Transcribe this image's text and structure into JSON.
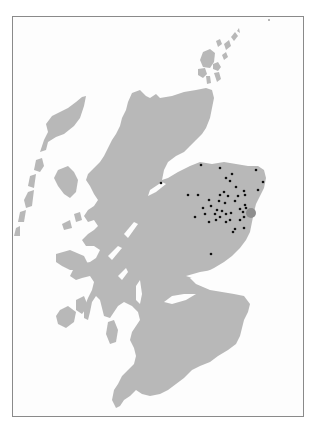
{
  "map": {
    "subject": "Scotland",
    "land_color": "#b8b8b8",
    "frame_color": "#8a8a8a",
    "dot_color": "#111111",
    "hub_color": "#8e8e8e",
    "hub": {
      "x": 251,
      "y": 213,
      "r": 5
    },
    "points": [
      {
        "x": 201,
        "y": 165
      },
      {
        "x": 161,
        "y": 183
      },
      {
        "x": 220,
        "y": 168
      },
      {
        "x": 232,
        "y": 174
      },
      {
        "x": 256,
        "y": 170
      },
      {
        "x": 263,
        "y": 182
      },
      {
        "x": 226,
        "y": 178
      },
      {
        "x": 230,
        "y": 181
      },
      {
        "x": 188,
        "y": 195
      },
      {
        "x": 198,
        "y": 195
      },
      {
        "x": 236,
        "y": 187
      },
      {
        "x": 224,
        "y": 192
      },
      {
        "x": 244,
        "y": 191
      },
      {
        "x": 245,
        "y": 195
      },
      {
        "x": 258,
        "y": 190
      },
      {
        "x": 209,
        "y": 200
      },
      {
        "x": 220,
        "y": 195
      },
      {
        "x": 228,
        "y": 196
      },
      {
        "x": 238,
        "y": 196
      },
      {
        "x": 219,
        "y": 201
      },
      {
        "x": 225,
        "y": 203
      },
      {
        "x": 235,
        "y": 201
      },
      {
        "x": 211,
        "y": 206
      },
      {
        "x": 203,
        "y": 208
      },
      {
        "x": 217,
        "y": 210
      },
      {
        "x": 222,
        "y": 211
      },
      {
        "x": 215,
        "y": 214
      },
      {
        "x": 226,
        "y": 214
      },
      {
        "x": 231,
        "y": 213
      },
      {
        "x": 240,
        "y": 209
      },
      {
        "x": 245,
        "y": 205
      },
      {
        "x": 243,
        "y": 212
      },
      {
        "x": 246,
        "y": 208
      },
      {
        "x": 195,
        "y": 217
      },
      {
        "x": 205,
        "y": 214
      },
      {
        "x": 220,
        "y": 217
      },
      {
        "x": 230,
        "y": 220
      },
      {
        "x": 240,
        "y": 220
      },
      {
        "x": 244,
        "y": 217
      },
      {
        "x": 209,
        "y": 222
      },
      {
        "x": 235,
        "y": 229
      },
      {
        "x": 233,
        "y": 232
      },
      {
        "x": 244,
        "y": 228
      },
      {
        "x": 211,
        "y": 254
      },
      {
        "x": 216,
        "y": 220
      },
      {
        "x": 226,
        "y": 222
      }
    ],
    "scale_marks": [
      {
        "x": 268,
        "y": 20
      }
    ]
  }
}
